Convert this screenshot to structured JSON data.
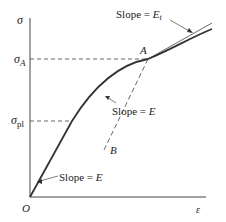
{
  "diagram": {
    "axes": {
      "y_label": "σ",
      "x_label": "ε",
      "origin_label": "O"
    },
    "levels": {
      "sigma_A": {
        "symbol": "σ",
        "subscript": "A"
      },
      "sigma_pl": {
        "symbol": "σ",
        "subscript": "pl"
      }
    },
    "points": {
      "A": "A",
      "B": "B"
    },
    "annotations": {
      "slope_Et": {
        "prefix": "Slope = ",
        "symbol": "E",
        "subscript": "t"
      },
      "slope_E_middle": {
        "prefix": "Slope = ",
        "symbol": "E"
      },
      "slope_E_bottom": {
        "prefix": "Slope = ",
        "symbol": "E"
      }
    },
    "colors": {
      "curve": "#333333",
      "axis": "#444444",
      "dashed": "#555555",
      "text": "#222222"
    }
  }
}
